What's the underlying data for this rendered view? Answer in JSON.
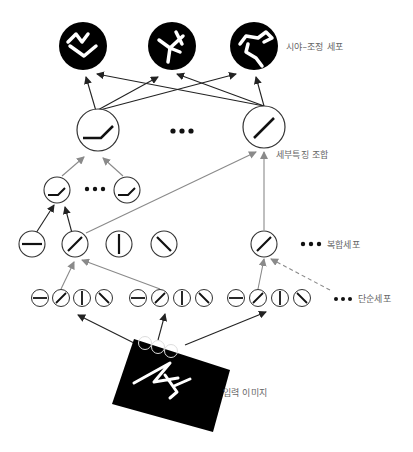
{
  "labels": {
    "view_tuned_cells": "시야–조정 세포",
    "feature_combination": "세부특징 조합",
    "complex_cells": "복합세포",
    "simple_cells": "단순세포",
    "input_image": "입력 이미지"
  },
  "ellipsis": "•••",
  "layers": [
    {
      "name": "view-tuned-cells",
      "count": 3,
      "style": "black-filled"
    },
    {
      "name": "feature-combination-top",
      "count": 2,
      "glyphs": [
        "bent-line",
        "diagonal"
      ]
    },
    {
      "name": "feature-combination-low",
      "count": 2,
      "glyphs": [
        "bent-line",
        "bent-line"
      ]
    },
    {
      "name": "complex-cells",
      "count": 5,
      "glyphs": [
        "horizontal",
        "diagonal",
        "vertical",
        "backslash",
        "diagonal"
      ]
    },
    {
      "name": "simple-cells",
      "groups": 3,
      "per_group": 4,
      "glyphs": [
        "horizontal",
        "diagonal",
        "vertical",
        "backslash"
      ]
    },
    {
      "name": "input-image",
      "receptive_fields": 3
    }
  ],
  "colors": {
    "black_arrow": "#222222",
    "gray_arrow": "#8a8a8a",
    "label_text": "#666666",
    "node_outline": "#333333"
  }
}
